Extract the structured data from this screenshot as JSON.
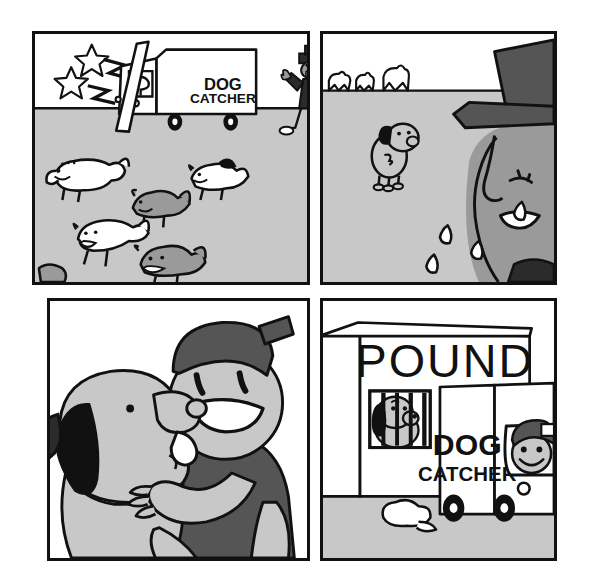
{
  "comic": {
    "title": "Dog Catcher comic strip",
    "page_background": "#ffffff",
    "palette": {
      "ink": "#111111",
      "ground_gray": "#c8c8c8",
      "sky_white": "#ffffff",
      "mid_gray": "#9a9a9a",
      "dark_gray": "#555555",
      "light_gray": "#d9d9d9",
      "near_black": "#2b2b2b"
    },
    "panels": [
      {
        "id": "panel-1",
        "name": "panel-dogs-escaping",
        "position": {
          "x": 32,
          "y": 31,
          "width": 278,
          "height": 254
        },
        "description": "Dogs escape from the dog catcher truck while the dog catcher rages",
        "signage": [
          {
            "name": "truck-sign-line-1",
            "text": "DOG"
          },
          {
            "name": "truck-sign-line-2",
            "text": "CATCHER"
          }
        ],
        "elements": [
          {
            "name": "anger-star",
            "count": 2
          },
          {
            "name": "anger-zigzag",
            "count": 2
          },
          {
            "name": "dog-catcher-truck",
            "count": 1
          },
          {
            "name": "open-truck-door",
            "count": 1
          },
          {
            "name": "angry-dog-catcher-man",
            "count": 1
          },
          {
            "name": "running-dog",
            "count": 6
          }
        ]
      },
      {
        "id": "panel-2",
        "name": "panel-dog-catcher-crying",
        "position": {
          "x": 320,
          "y": 31,
          "width": 237,
          "height": 254
        },
        "description": "The dog catcher cries in close-up as the last dogs run to the horizon",
        "signage": [],
        "elements": [
          {
            "name": "horizon-dog-silhouette",
            "count": 3
          },
          {
            "name": "lone-dog",
            "count": 1
          },
          {
            "name": "crying-face-profile",
            "count": 1
          },
          {
            "name": "top-hat",
            "count": 1
          },
          {
            "name": "tear-drop",
            "count": 4
          }
        ]
      },
      {
        "id": "panel-3",
        "name": "panel-boy-hugging-dog",
        "position": {
          "x": 47,
          "y": 298,
          "width": 263,
          "height": 263
        },
        "description": "Close-up of a smiling boy in a cap hugging his dog, who licks his face",
        "signage": [],
        "elements": [
          {
            "name": "smiling-boy",
            "count": 1
          },
          {
            "name": "boy-cap",
            "count": 1
          },
          {
            "name": "happy-dog",
            "count": 1
          },
          {
            "name": "hugging-arms",
            "count": 2
          }
        ]
      },
      {
        "id": "panel-4",
        "name": "panel-pound-building",
        "position": {
          "x": 320,
          "y": 298,
          "width": 237,
          "height": 263
        },
        "description": "The dog catcher truck parked at the POUND where a sad dog sits behind bars",
        "signage": [
          {
            "name": "building-sign",
            "text": "POUND"
          },
          {
            "name": "truck-sign-line-1",
            "text": "DOG"
          },
          {
            "name": "truck-sign-line-2",
            "text": "CATCHER"
          }
        ],
        "elements": [
          {
            "name": "pound-building",
            "count": 1
          },
          {
            "name": "barred-window",
            "count": 1
          },
          {
            "name": "caged-sad-dog",
            "count": 1
          },
          {
            "name": "dog-catcher-truck",
            "count": 1
          },
          {
            "name": "smiling-driver",
            "count": 1
          },
          {
            "name": "exhaust-cloud",
            "count": 1
          }
        ]
      }
    ]
  }
}
